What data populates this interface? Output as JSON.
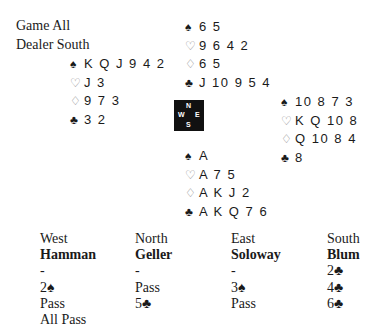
{
  "deal_info": {
    "vulnerability": "Game All",
    "dealer": "Dealer South"
  },
  "suit_symbols": {
    "spades": "♠",
    "hearts": "♡",
    "diamonds": "♢",
    "clubs": "♣"
  },
  "hands": {
    "north": {
      "spades": "6 5",
      "hearts": "9 6 4 2",
      "diamonds": "6 5",
      "clubs": "J 10 9 5 4"
    },
    "west": {
      "spades": "K Q J 9 4 2",
      "hearts": "J 3",
      "diamonds": "9 7 3",
      "clubs": "3 2"
    },
    "east": {
      "spades": "10 8 7 3",
      "hearts": "K Q 10 8",
      "diamonds": "Q 10 8 4",
      "clubs": "8"
    },
    "south": {
      "spades": "A",
      "hearts": "A 7 5",
      "diamonds": "A K J 2",
      "clubs": "A K Q 7 6"
    }
  },
  "compass": {
    "n": "N",
    "s": "S",
    "w": "W",
    "e": "E"
  },
  "bidding": {
    "headers": [
      "West",
      "North",
      "East",
      "South"
    ],
    "players": [
      "Hamman",
      "Geller",
      "Soloway",
      "Blum"
    ],
    "rounds": [
      [
        "-",
        "-",
        "-",
        "2♣"
      ],
      [
        "2♠",
        "Pass",
        "3♠",
        "4♣"
      ],
      [
        "Pass",
        "5♣",
        "Pass",
        "6♣"
      ],
      [
        "All Pass",
        "",
        "",
        ""
      ]
    ]
  }
}
